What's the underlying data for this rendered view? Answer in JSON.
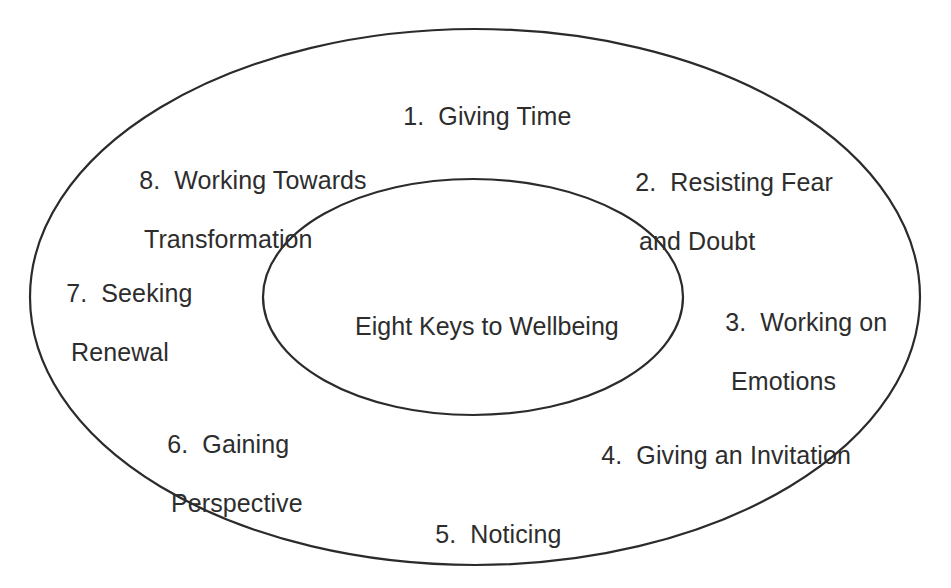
{
  "diagram": {
    "title": "Eight Keys to Wellbeing",
    "center_label": "Eight Keys to Wellbeing",
    "stroke_color": "#2b2b2b",
    "text_color": "#2d2d2d",
    "background_color": "#ffffff",
    "outer_ellipse": {
      "cx": 475,
      "cy": 297,
      "rx": 445,
      "ry": 268
    },
    "inner_ellipse": {
      "cx": 473,
      "cy": 297,
      "rx": 210,
      "ry": 118
    },
    "keys": [
      {
        "number": "1.",
        "line1": "Giving Time",
        "line2": ""
      },
      {
        "number": "2.",
        "line1": "Resisting Fear",
        "line2": "and Doubt"
      },
      {
        "number": "3.",
        "line1": "Working on",
        "line2": "Emotions"
      },
      {
        "number": "4.",
        "line1": "Giving an Invitation",
        "line2": ""
      },
      {
        "number": "5.",
        "line1": "Noticing",
        "line2": ""
      },
      {
        "number": "6.",
        "line1": "Gaining",
        "line2": "Perspective"
      },
      {
        "number": "7.",
        "line1": "Seeking",
        "line2": "Renewal"
      },
      {
        "number": "8.",
        "line1": "Working Towards",
        "line2": "Transformation"
      }
    ]
  }
}
